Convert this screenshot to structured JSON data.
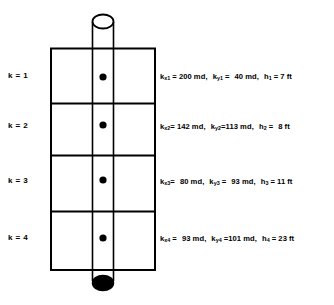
{
  "figure": {
    "type": "layered-reservoir-wellbore-schematic",
    "layer_labels": [
      {
        "text": "k = 1"
      },
      {
        "text": "k = 2"
      },
      {
        "text": "k = 3"
      },
      {
        "text": "k = 4"
      }
    ],
    "layers": [
      {
        "index": "1",
        "kx_symbol": "k",
        "kx_sub": "x",
        "kx_value": "200",
        "kx_unit": "md",
        "ky_symbol": "k",
        "ky_sub": "y",
        "ky_value": "40",
        "ky_unit": "md",
        "h_symbol": "h",
        "h_value": "7",
        "h_unit": "ft"
      },
      {
        "index": "2",
        "kx_symbol": "k",
        "kx_sub": "x",
        "kx_value": "142",
        "kx_unit": "md",
        "ky_symbol": "k",
        "ky_sub": "y",
        "ky_value": "113",
        "ky_unit": "md",
        "h_symbol": "h",
        "h_value": "8",
        "h_unit": "ft"
      },
      {
        "index": "3",
        "kx_symbol": "k",
        "kx_sub": "x",
        "kx_value": "80",
        "kx_unit": "md",
        "ky_symbol": "k",
        "ky_sub": "y",
        "ky_value": "93",
        "ky_unit": "md",
        "h_symbol": "h",
        "h_value": "11",
        "h_unit": "ft"
      },
      {
        "index": "4",
        "kx_symbol": "k",
        "kx_sub": "x",
        "kx_value": "93",
        "kx_unit": "md",
        "ky_symbol": "k",
        "ky_sub": "y",
        "ky_value": "101",
        "ky_unit": "md",
        "h_symbol": "h",
        "h_value": "23",
        "h_unit": "ft"
      }
    ],
    "separators": {
      "equals": "=",
      "comma": ","
    },
    "colors": {
      "stroke": "#000000",
      "background": "#ffffff",
      "well_bottom_fill": "#000000",
      "perforation_dot": "#000000"
    }
  }
}
